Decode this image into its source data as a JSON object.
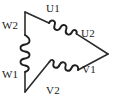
{
  "diagram": {
    "type": "delta-winding-connection",
    "colors": {
      "wire": "#2b2b2b",
      "coil": "#1f1f1f",
      "background": "#ffffff",
      "text": "#1a1a1a"
    },
    "vertices": {
      "top_left": {
        "x": 25,
        "y": 12
      },
      "right": {
        "x": 108,
        "y": 54
      },
      "bottom_left": {
        "x": 25,
        "y": 92
      }
    },
    "terminals": [
      {
        "id": "W2",
        "label": "W2",
        "position": "upper-left",
        "x": 2,
        "y": 20
      },
      {
        "id": "U1",
        "label": "U1",
        "position": "top",
        "x": 46,
        "y": 3
      },
      {
        "id": "U2",
        "label": "U2",
        "position": "right-upper",
        "x": 81,
        "y": 28
      },
      {
        "id": "V1",
        "label": "V1",
        "position": "right-lower",
        "x": 82,
        "y": 64
      },
      {
        "id": "V2",
        "label": "V2",
        "position": "bottom",
        "x": 46,
        "y": 85
      },
      {
        "id": "W1",
        "label": "W1",
        "position": "lower-left",
        "x": 2,
        "y": 69
      }
    ],
    "windings": [
      {
        "id": "W",
        "name": "W-winding",
        "side": "left-vertical",
        "from": "W2",
        "to": "W1",
        "turns": 4
      },
      {
        "id": "U",
        "name": "U-winding",
        "side": "upper-right",
        "from": "U1",
        "to": "U2",
        "turns": 5
      },
      {
        "id": "V",
        "name": "V-winding",
        "side": "lower-right",
        "from": "V2",
        "to": "V1",
        "turns": 5
      }
    ]
  }
}
